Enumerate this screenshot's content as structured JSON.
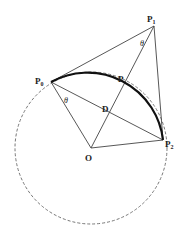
{
  "diagram": {
    "points": {
      "P0": {
        "label": "P",
        "sub": "0",
        "x": 51,
        "y": 82
      },
      "P1": {
        "label": "P",
        "sub": "1",
        "x": 154,
        "y": 26
      },
      "P2": {
        "label": "P",
        "sub": "2",
        "x": 163,
        "y": 140
      },
      "O": {
        "label": "O",
        "x": 91,
        "y": 148
      },
      "D": {
        "label": "D",
        "x": 110,
        "y": 114
      },
      "P": {
        "label": "P",
        "x": 124,
        "y": 87
      }
    },
    "angles": {
      "theta_at_P1": "θ",
      "theta_at_P0": "θ"
    },
    "circle": {
      "cx": 91,
      "cy": 148,
      "r": 76,
      "style": "dashed"
    },
    "arc": {
      "from": "P0",
      "to": "P2",
      "style": "bold"
    },
    "colors": {
      "line": "#444444",
      "arc": "#111111",
      "dashed": "#777777"
    }
  }
}
